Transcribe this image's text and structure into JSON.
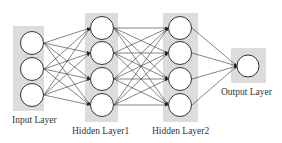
{
  "diagram": {
    "colors": {
      "layer_box": "#dcdcdc",
      "node_fill": "#ffffff",
      "node_stroke": "#333333",
      "edge": "#333333",
      "text": "#333333"
    },
    "layers": [
      {
        "id": "input",
        "label": "Input Layer",
        "nodes": 3
      },
      {
        "id": "hidden1",
        "label": "Hidden Layer1",
        "nodes": 4
      },
      {
        "id": "hidden2",
        "label": "Hidden Layer2",
        "nodes": 4
      },
      {
        "id": "output",
        "label": "Output Layer",
        "nodes": 1
      }
    ],
    "connections": "fully connected between consecutive layers, arrows pointing right"
  }
}
